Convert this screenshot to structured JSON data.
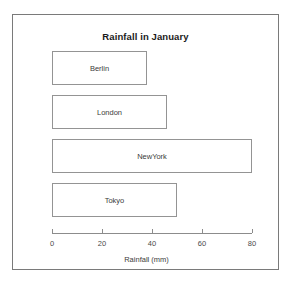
{
  "figure": {
    "title": "Rainfall in January",
    "border_color": "#7a7a7a",
    "background": "#ffffff"
  },
  "chart_data": {
    "type": "bar",
    "orientation": "horizontal",
    "title": "Rainfall in January",
    "xlabel": "Rainfall (mm)",
    "ylabel": "",
    "categories": [
      "Berlin",
      "London",
      "NewYork",
      "Tokyo"
    ],
    "values": [
      38,
      46,
      80,
      50
    ],
    "bar_labels": [
      "Berlin",
      "London",
      "NewYork",
      "Tokyo"
    ],
    "xlim": [
      0,
      80
    ],
    "xticks": [
      0,
      20,
      40,
      60,
      80
    ],
    "xtick_labels": [
      "0",
      "20",
      "40",
      "60",
      "80"
    ],
    "grid": false,
    "legend": false,
    "bar_fill_color": "#ffffff",
    "bar_edge_color": "#949494",
    "axis_color": "#8c8c8c",
    "text_color": "#3b3b3b"
  },
  "axis": {
    "title": "Rainfall (mm)"
  }
}
